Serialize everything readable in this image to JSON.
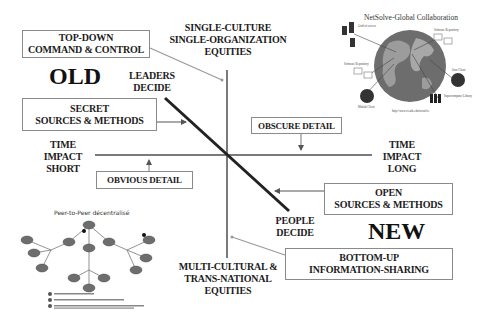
{
  "diagram": {
    "top_axis_label": [
      "SINGLE-CULTURE",
      "SINGLE-ORGANIZATION",
      "EQUITIES"
    ],
    "bottom_axis_label": [
      "MULTI-CULTURAL &",
      "TRANS-NATIONAL",
      "EQUITIES"
    ],
    "left_axis_label": [
      "TIME",
      "IMPACT",
      "SHORT"
    ],
    "right_axis_label": [
      "TIME",
      "IMPACT",
      "LONG"
    ],
    "diagonal_start_label": [
      "LEADERS",
      "DECIDE"
    ],
    "diagonal_end_label": [
      "PEOPLE",
      "DECIDE"
    ],
    "old_label": "OLD",
    "new_label": "NEW",
    "boxes": {
      "top_down": [
        "TOP-DOWN",
        "COMMAND & CONTROL"
      ],
      "secret": [
        "SECRET",
        "SOURCES & METHODS"
      ],
      "obvious": [
        "OBVIOUS DETAIL"
      ],
      "obscure": [
        "OBSCURE DETAIL"
      ],
      "open": [
        "OPEN",
        "SOURCES & METHODS"
      ],
      "bottom_up": [
        "BOTTOM-UP",
        "INFORMATION-SHARING"
      ]
    },
    "colors": {
      "axis": "#7a7a7a",
      "diagonal": "#222222",
      "connector": "#9a9a9a",
      "globe_ocean": "#6d6d6d",
      "globe_land": "#9c9c9c"
    }
  },
  "inset_globe": {
    "title": "NetSolve-Global Collaboration",
    "nodes": [
      "Grid of servers",
      "Software Repository",
      "Software Repository",
      "Java Client",
      "Supercomputer Library",
      "Matlab Client"
    ],
    "footer": "http://www.cs.utk.edu/netsolve"
  },
  "inset_p2p": {
    "title": "Peer-to-Peer décentralisé",
    "legend": [
      "Ordinateur en réseau",
      "Routage de requêtes",
      "Transfert de fichiers"
    ]
  }
}
